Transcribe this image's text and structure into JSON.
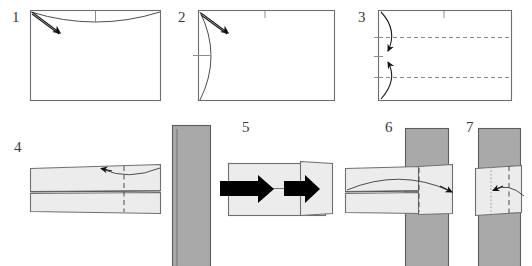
{
  "figure": {
    "kind": "origami-fold-instructions",
    "panel_count": 7,
    "background_color": "#ffffff"
  },
  "palette": {
    "paper_light": "#ececec",
    "paper_white": "#ffffff",
    "paper_gray": "#a9a9a9",
    "outline": "#6f6f6f",
    "fold_line": "#4a4a4a",
    "arrow_black": "#000000",
    "number_color": "#3a3a3a"
  },
  "steps": [
    {
      "number": "1",
      "label_x": 12,
      "label_y": 22,
      "description": "Rectangular sheet, fold top edge down along a shallow curved crease; arrow points down-right from top-left corner."
    },
    {
      "number": "2",
      "label_x": 178,
      "label_y": 22,
      "description": "Rectangular sheet with a curved crease bowing out on the left side; arrow points down-right from top-left corner."
    },
    {
      "number": "3",
      "label_x": 358,
      "label_y": 22,
      "description": "Rectangular sheet with two horizontal dashed fold lines; curved arrows bring top and bottom edges toward the centre."
    },
    {
      "number": "4",
      "label_x": 14,
      "label_y": 152,
      "description": "Folded flat strip with a horizontal mid seam and a vertical dashed crease; curved arrow sweeps to the left."
    },
    {
      "number": "5",
      "label_x": 242,
      "label_y": 132,
      "description": "Grey upright band beside a light strip; two solid block arrows indicate pushing the strip to the right."
    },
    {
      "number": "6",
      "label_x": 385,
      "label_y": 132,
      "description": "Light strip threaded across the grey upright band; long curved arrow sweeps right across the band."
    },
    {
      "number": "7",
      "label_x": 466,
      "label_y": 132,
      "description": "Light strip wrapped on the grey band with a dotted crease and a dashed crease; curved arrow points left."
    }
  ],
  "marks": {
    "dashed_fold_label": "valley fold (dashed)",
    "dotted_fold_label": "hidden edge (dotted)",
    "curved_arrow_label": "fold direction",
    "block_arrow_label": "push / insert direction",
    "tick_label": "centre tick mark"
  }
}
